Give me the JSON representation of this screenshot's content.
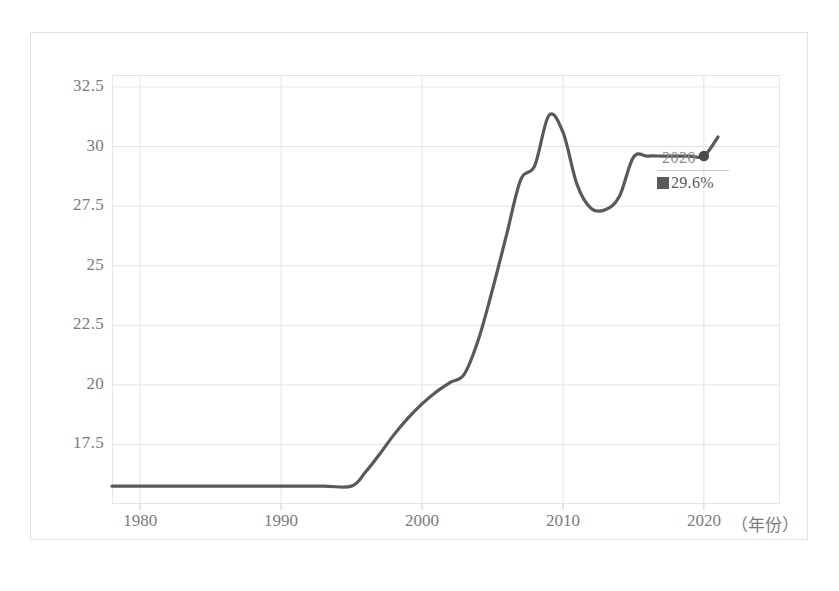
{
  "chart_data": {
    "type": "line",
    "title": "",
    "xlabel": "（年份）",
    "ylabel": "",
    "xlim": [
      1978,
      2025.4
    ],
    "ylim": [
      15.0,
      33.0
    ],
    "grid": true,
    "legend_position": "none",
    "line_color": "#595959",
    "x_ticks": [
      "1980",
      "1990",
      "2000",
      "2010",
      "2020"
    ],
    "x_tick_values": [
      1980,
      1990,
      2000,
      2010,
      2020
    ],
    "y_ticks": [
      "17.5",
      "20",
      "22.5",
      "25",
      "27.5",
      "30",
      "32.5"
    ],
    "y_tick_values": [
      17.5,
      20,
      22.5,
      25,
      27.5,
      30,
      32.5
    ],
    "x": [
      1978,
      1980,
      1985,
      1990,
      1993,
      1995,
      1996,
      1997,
      1998,
      1999,
      2000,
      2001,
      2002,
      2003,
      2004,
      2005,
      2006,
      2007,
      2008,
      2009,
      2010,
      2011,
      2012,
      2013,
      2014,
      2015,
      2016,
      2017,
      2018,
      2019,
      2020,
      2021
    ],
    "y": [
      15.75,
      15.75,
      15.75,
      15.75,
      15.75,
      15.75,
      16.35,
      17.1,
      17.9,
      18.6,
      19.2,
      19.7,
      20.1,
      20.45,
      21.9,
      24.0,
      26.3,
      28.6,
      29.2,
      31.3,
      30.6,
      28.4,
      27.4,
      27.35,
      27.9,
      29.55,
      29.6,
      29.6,
      29.6,
      29.6,
      29.6,
      30.4
    ],
    "highlight_point": {
      "year": "2020",
      "value": "29.6%",
      "x": 2020,
      "y": 29.6,
      "marker_color": "#4a4a4a"
    }
  },
  "axis": {
    "x_title": "（年份）"
  }
}
